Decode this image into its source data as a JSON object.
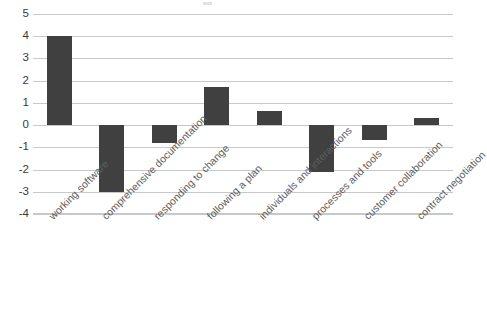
{
  "chart_data": {
    "type": "bar",
    "title": "",
    "subtitle": "",
    "xlabel": "",
    "ylabel": "",
    "orientation": "vertical",
    "grid": true,
    "grid_axis": "y",
    "legend": false,
    "legend_position": "none",
    "bar_color": "#404040",
    "gridline_color": "#c8c8c8",
    "label_color": "#5e5e5e",
    "tick_color": "#3a3a3a",
    "background": "#ffffff",
    "x_label_rotation_deg": -45,
    "ylim": [
      -4,
      5
    ],
    "ytick_step": 1,
    "yticks": [
      "5",
      "4",
      "3",
      "2",
      "1",
      "0",
      "-1",
      "-2",
      "-3",
      "-4"
    ],
    "ytick_values": [
      5,
      4,
      3,
      2,
      1,
      0,
      -1,
      -2,
      -3,
      -4
    ],
    "categories": [
      "working software",
      "comprehensive documentation",
      "responding to change",
      "following a plan",
      "individuals and interactions",
      "processes and tools",
      "customer collaboration",
      "contract negotiation"
    ],
    "values": [
      4,
      -3,
      -0.8,
      1.7,
      0.65,
      -2.1,
      -0.65,
      0.3
    ]
  }
}
